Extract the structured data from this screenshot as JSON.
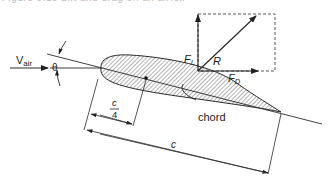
{
  "caption": "Figure 9.10  Lift and drag on an airfoil",
  "labels": {
    "v": "V",
    "v_sub": "air",
    "theta": "θ",
    "lift": "F",
    "lift_sub": "L",
    "resultant": "R",
    "drag": "F",
    "drag_sub": "D",
    "chord": "chord",
    "quarter_num": "c",
    "quarter_den": "4",
    "chord_length": "c"
  },
  "colors": {
    "line": "#2a2a2a",
    "hatch": "#555555",
    "dashed": "#444444"
  }
}
